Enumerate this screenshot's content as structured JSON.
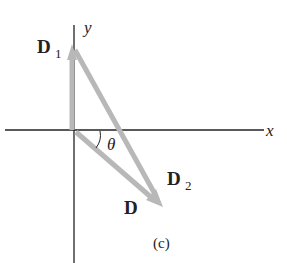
{
  "diagram": {
    "axes": {
      "x_label": "x",
      "y_label": "y"
    },
    "vectors": [
      {
        "name": "D",
        "sub": "1"
      },
      {
        "name": "D",
        "sub": "2"
      },
      {
        "name": "D",
        "sub": ""
      }
    ],
    "angle_label": "θ",
    "caption": "(c)",
    "colors": {
      "axis": "#222222",
      "vector": "#b8b8b8"
    }
  }
}
